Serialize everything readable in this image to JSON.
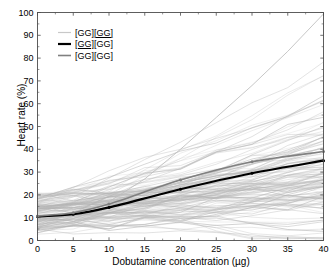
{
  "chart_data": {
    "type": "line",
    "title": "",
    "xlabel": "Dobutamine concentration (µg)",
    "ylabel": "Heart rate (%)",
    "xlim": [
      0,
      40
    ],
    "ylim": [
      0,
      100
    ],
    "xticks": [
      0,
      5,
      10,
      15,
      20,
      25,
      30,
      35,
      40
    ],
    "xtick_labels": [
      "0",
      "5",
      "10",
      "15",
      "20",
      "25",
      "30",
      "35",
      "40"
    ],
    "yticks": [
      0,
      10,
      20,
      30,
      40,
      50,
      60,
      70,
      80,
      90,
      100
    ],
    "ytick_labels": [
      "0",
      "10",
      "20",
      "30",
      "40",
      "50",
      "60",
      "70",
      "80",
      "90",
      "100"
    ],
    "grid": false,
    "legend_position": "upper-left-inside",
    "x": [
      0,
      5,
      10,
      20,
      30,
      40
    ],
    "series": [
      {
        "name": "[GG][GG] light",
        "label_plain": "[GG][GG]",
        "genotype_prefix": "[GG]",
        "genotype_suffix": "[GG]",
        "underline": "second",
        "color": "#c8c8c8",
        "width": 1.2,
        "marker": "none",
        "role": "mean-light",
        "values": [
          10.5,
          12.5,
          16.5,
          25.5,
          33.5,
          40.5
        ]
      },
      {
        "name": "[GG][GG] black",
        "label_plain": "[GG][GG]",
        "genotype_prefix": "[GG]",
        "genotype_suffix": "[GG]",
        "underline": "first",
        "color": "#000000",
        "width": 2.2,
        "marker": "dot",
        "role": "mean-black",
        "values": [
          10.5,
          11.5,
          14.5,
          22.5,
          29.5,
          35.0
        ]
      },
      {
        "name": "[GG][GG] gray",
        "label_plain": "[GG][GG]",
        "genotype_prefix": "[GG]",
        "genotype_suffix": "[GG]",
        "underline": "none",
        "color": "#808080",
        "width": 1.6,
        "marker": "dot",
        "role": "mean-gray",
        "values": [
          10.8,
          12.2,
          16.0,
          26.5,
          34.5,
          39.0
        ]
      }
    ],
    "individual_traces_note": "~120 faint gray individual subject trajectories",
    "individual_traces_color": "#b4b4b4",
    "outlier_note": "one steep trace rising to ~100% at 40 µg"
  },
  "legend": {
    "entries": [
      {
        "label": "[GG][GG]",
        "prefix": "[GG]",
        "suffix": "[GG]",
        "underline": "second",
        "color": "#c8c8c8"
      },
      {
        "label": "[GG][GG]",
        "prefix": "[GG]",
        "suffix": "[GG]",
        "underline": "first",
        "color": "#000000"
      },
      {
        "label": "[GG][GG]",
        "prefix": "[GG]",
        "suffix": "[GG]",
        "underline": "none",
        "color": "#808080"
      }
    ]
  },
  "axes": {
    "x_title": "Dobutamine concentration (µg)",
    "y_title": "Heart rate (%)"
  },
  "colors": {
    "axis": "#4d4d4d",
    "text": "#000000",
    "background": "#ffffff",
    "trace": "#b4b4b4"
  }
}
